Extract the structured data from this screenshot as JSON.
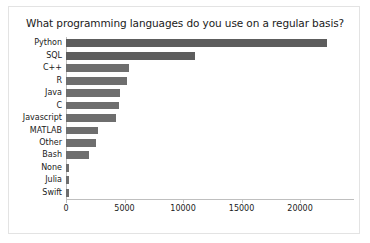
{
  "figure": {
    "background_color": "#ffffff",
    "border_color": "#e3e3e3",
    "bar_color": "#6e6e6e",
    "axis_color": "#bfbfbf",
    "text_color": "#1a1a1a"
  },
  "chart_data": {
    "type": "bar",
    "orientation": "horizontal",
    "title": "What programming languages do you use on a regular basis?",
    "xlabel": "",
    "ylabel": "",
    "categories": [
      "Python",
      "SQL",
      "C++",
      "R",
      "Java",
      "C",
      "Javascript",
      "MATLAB",
      "Other",
      "Bash",
      "None",
      "Julia",
      "Swift"
    ],
    "values": [
      22300,
      11000,
      5350,
      5250,
      4650,
      4550,
      4300,
      2750,
      2550,
      2000,
      250,
      250,
      250
    ],
    "xlim": [
      0,
      23500
    ],
    "xticks": [
      0,
      5000,
      10000,
      15000,
      20000
    ],
    "xtick_labels": [
      "0",
      "5000",
      "10000",
      "15000",
      "20000"
    ],
    "grid": false,
    "legend": null
  }
}
